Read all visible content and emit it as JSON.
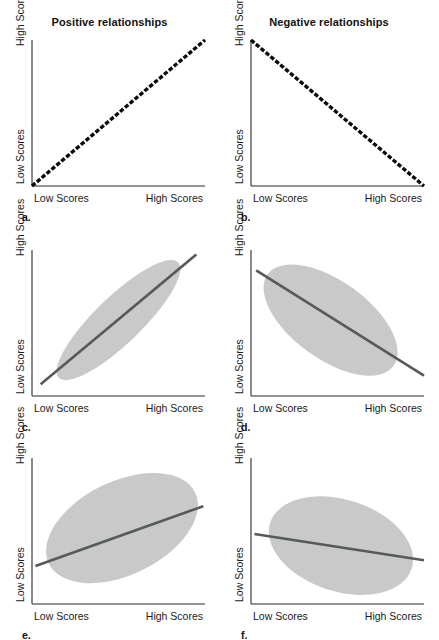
{
  "figure": {
    "width": 439,
    "height": 640,
    "background": "#ffffff",
    "blob_color": "#c9c9c9",
    "trend_color": "#555a5c",
    "axis_color": "#2b2b2b",
    "dotted_line_color": "#0b0b0b"
  },
  "columns": {
    "positive_title": "Positive relationships",
    "negative_title": "Negative relationships"
  },
  "labels": {
    "x_low": "Low Scores",
    "x_high": "High Scores",
    "y_low": "Low Scores",
    "y_high": "High Scores"
  },
  "chart_data": [
    {
      "id": "a",
      "type": "line",
      "letter": "a.",
      "title": "Positive relationships",
      "relationship": "perfect positive",
      "style": "dotted",
      "line": {
        "x1": 0.0,
        "y1": 0.0,
        "x2": 1.0,
        "y2": 1.0
      },
      "blob": null,
      "xlabel_low": "Low Scores",
      "xlabel_high": "High Scores",
      "ylabel_low": "Low Scores",
      "ylabel_high": "High Scores",
      "xlim": [
        0,
        1
      ],
      "ylim": [
        0,
        1
      ],
      "grid": false
    },
    {
      "id": "b",
      "type": "line",
      "letter": "b.",
      "title": "Negative relationships",
      "relationship": "perfect negative",
      "style": "dotted",
      "line": {
        "x1": 0.0,
        "y1": 1.0,
        "x2": 1.0,
        "y2": 0.0
      },
      "blob": null,
      "xlabel_low": "Low Scores",
      "xlabel_high": "High Scores",
      "ylabel_low": "Low Scores",
      "ylabel_high": "High Scores",
      "xlim": [
        0,
        1
      ],
      "ylim": [
        0,
        1
      ],
      "grid": false
    },
    {
      "id": "c",
      "type": "scatter",
      "letter": "c.",
      "title": "Positive relationships",
      "relationship": "strong positive",
      "style": "solid",
      "line": {
        "x1": 0.05,
        "y1": 0.08,
        "x2": 0.95,
        "y2": 0.97
      },
      "blob": {
        "cx": 0.5,
        "cy": 0.52,
        "rx": 0.48,
        "ry": 0.135,
        "rotate": -44
      },
      "xlabel_low": "Low Scores",
      "xlabel_high": "High Scores",
      "ylabel_low": "Low Scores",
      "ylabel_high": "High Scores",
      "xlim": [
        0,
        1
      ],
      "ylim": [
        0,
        1
      ],
      "grid": false
    },
    {
      "id": "d",
      "type": "scatter",
      "letter": "d.",
      "title": "Negative relationships",
      "relationship": "strong negative",
      "style": "solid",
      "line": {
        "x1": 0.03,
        "y1": 0.86,
        "x2": 1.0,
        "y2": 0.14
      },
      "blob": {
        "cx": 0.46,
        "cy": 0.52,
        "rx": 0.45,
        "ry": 0.225,
        "rotate": 36
      },
      "xlabel_low": "Low Scores",
      "xlabel_high": "High Scores",
      "ylabel_low": "Low Scores",
      "ylabel_high": "High Scores",
      "xlim": [
        0,
        1
      ],
      "ylim": [
        0,
        1
      ],
      "grid": false
    },
    {
      "id": "e",
      "type": "scatter",
      "letter": "e.",
      "title": "Positive relationships",
      "relationship": "moderate positive",
      "style": "solid",
      "line": {
        "x1": 0.02,
        "y1": 0.26,
        "x2": 0.99,
        "y2": 0.67
      },
      "blob": {
        "cx": 0.52,
        "cy": 0.52,
        "rx": 0.47,
        "ry": 0.27,
        "rotate": -26
      },
      "xlabel_low": "Low Scores",
      "xlabel_high": "High Scores",
      "ylabel_low": "Low Scores",
      "ylabel_high": "High Scores",
      "xlim": [
        0,
        1
      ],
      "ylim": [
        0,
        1
      ],
      "grid": false
    },
    {
      "id": "f",
      "type": "scatter",
      "letter": "f.",
      "title": "Negative relationships",
      "relationship": "moderate negative",
      "style": "solid",
      "line": {
        "x1": 0.02,
        "y1": 0.48,
        "x2": 1.0,
        "y2": 0.3
      },
      "blob": {
        "cx": 0.52,
        "cy": 0.4,
        "rx": 0.43,
        "ry": 0.265,
        "rotate": 18
      },
      "xlabel_low": "Low Scores",
      "xlabel_high": "High Scores",
      "ylabel_low": "Low Scores",
      "ylabel_high": "High Scores",
      "xlim": [
        0,
        1
      ],
      "ylim": [
        0,
        1
      ],
      "grid": false
    }
  ]
}
